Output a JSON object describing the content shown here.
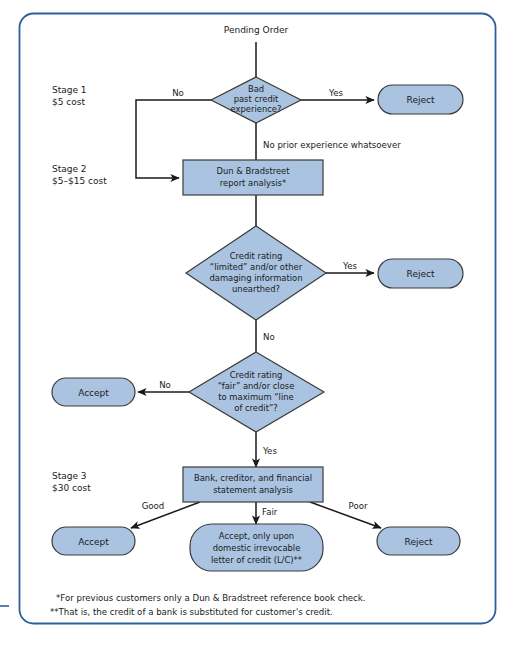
{
  "frame": {
    "border_color": "#2d5f9e",
    "background": "#ffffff",
    "edge_tick_color": "#2d5f9e"
  },
  "palette": {
    "shape_fill": "#a9c3e0",
    "shape_stroke": "#3b3b3b",
    "line_color": "#1a1a1a",
    "text_color": "#1a1a1a"
  },
  "start": {
    "label": "Pending Order"
  },
  "stages": [
    {
      "name": "Stage 1",
      "cost": "$5 cost"
    },
    {
      "name": "Stage 2",
      "cost": "$5–$15 cost"
    },
    {
      "name": "Stage 3",
      "cost": "$30 cost"
    }
  ],
  "nodes": {
    "decision_bad_credit": {
      "type": "decision",
      "lines": [
        "Bad",
        "past credit",
        "experience?"
      ]
    },
    "reject_stage1": {
      "type": "terminator",
      "lines": [
        "Reject"
      ]
    },
    "process_dnb": {
      "type": "process",
      "lines": [
        "Dun & Bradstreet",
        "report analysis*"
      ]
    },
    "decision_limited_rating": {
      "type": "decision",
      "lines": [
        "Credit rating",
        "“limited” and/or other",
        "damaging information",
        "unearthed?"
      ]
    },
    "reject_stage2": {
      "type": "terminator",
      "lines": [
        "Reject"
      ]
    },
    "decision_fair_rating": {
      "type": "decision",
      "lines": [
        "Credit rating",
        "“fair” and/or close",
        "to maximum “line",
        "of credit”?"
      ]
    },
    "accept_stage2": {
      "type": "terminator",
      "lines": [
        "Accept"
      ]
    },
    "process_bank_analysis": {
      "type": "process",
      "lines": [
        "Bank, creditor, and financial",
        "statement analysis"
      ]
    },
    "accept_good": {
      "type": "terminator",
      "lines": [
        "Accept"
      ]
    },
    "accept_fair_lc": {
      "type": "terminator",
      "lines": [
        "Accept, only upon",
        "domestic irrevocable",
        "letter of credit (L/C)**"
      ]
    },
    "reject_poor": {
      "type": "terminator",
      "lines": [
        "Reject"
      ]
    }
  },
  "edge_labels": {
    "no_bad_credit": "No",
    "yes_bad_credit": "Yes",
    "no_prior_experience": "No prior experience whatsoever",
    "yes_limited_rating": "Yes",
    "no_limited_rating": "No",
    "no_fair_rating": "No",
    "yes_fair_rating": "Yes",
    "good": "Good",
    "fair": "Fair",
    "poor": "Poor"
  },
  "footnotes": [
    "*For previous customers only a Dun & Bradstreet reference book check.",
    "**That is, the credit of a bank is substituted for customer's credit."
  ]
}
